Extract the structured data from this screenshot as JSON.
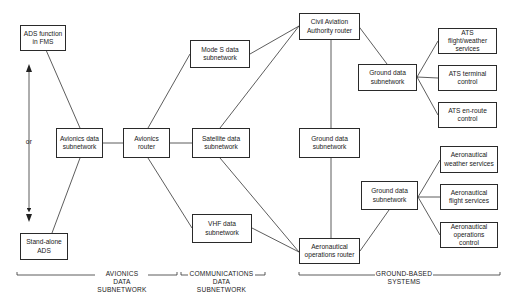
{
  "diagram": {
    "nodes": {
      "ads_fms": "ADS function in FMS",
      "standalone_ads": "Stand-alone ADS",
      "avionics_data_subnetwork": "Avionics data subnetwork",
      "avionics_router": "Avionics router",
      "mode_s": "Mode S data subnetwork",
      "satellite": "Satellite data subnetwork",
      "vhf": "VHF data subnetwork",
      "caa_router": "Civil Aviation Authority router",
      "ground_data_mid": "Ground data subnetwork",
      "aero_ops_router": "Aeronautical operations router",
      "ground_data_top": "Ground data subnetwork",
      "ats_flight_weather": "ATS flight/weather services",
      "ats_terminal": "ATS terminal control",
      "ats_enroute": "ATS en-route control",
      "ground_data_bottom": "Ground data subnetwork",
      "aero_weather": "Aeronautical weather services",
      "aero_flight": "Aeronautical flight services",
      "aero_ops_control": "Aeronautical operations control"
    },
    "or_label": "or",
    "sections": {
      "avionics": "AVIONICS DATA SUBNETWORK",
      "communications": "COMMUNICATIONS DATA SUBNETWORK",
      "ground": "GROUND-BASED SYSTEMS"
    }
  }
}
